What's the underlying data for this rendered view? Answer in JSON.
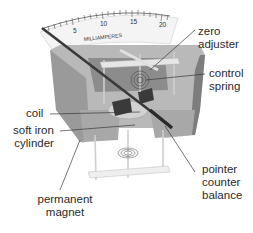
{
  "diagram": {
    "scale": {
      "unit_label": "MILLIAMPERES",
      "ticks": [
        "5",
        "10",
        "15",
        "20"
      ]
    },
    "labels": {
      "zero_adjuster": [
        "zero",
        "adjuster"
      ],
      "control_spring": [
        "control",
        "spring"
      ],
      "coil": [
        "coil"
      ],
      "soft_iron_cylinder": [
        "soft iron",
        "cylinder"
      ],
      "pointer_counter_balance": [
        "pointer",
        "counter",
        "balance"
      ],
      "permanent_magnet": [
        "permanent",
        "magnet"
      ]
    },
    "colors": {
      "background": "#ffffff",
      "magnet_top": "#b9b9b9",
      "magnet_front": "#9a9a9a",
      "magnet_side": "#7d7d7d",
      "scale_face": "#f4f4f4",
      "pointer": "#3a3a3a",
      "text": "#2a2a2a",
      "leader": "#3a3a3a"
    }
  }
}
